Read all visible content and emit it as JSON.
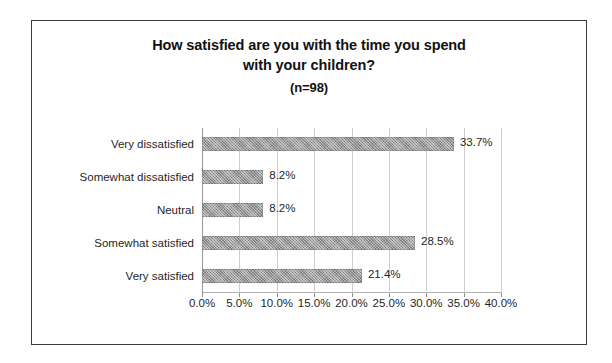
{
  "chart_data": {
    "type": "bar",
    "orientation": "horizontal",
    "title": "How satisfied are you with the time you spend with your children?",
    "title_line1": "How satisfied are you with the time you spend",
    "title_line2": "with your children?",
    "sample_size_label": "(n=98)",
    "sample_size": 98,
    "categories": [
      "Very dissatisfied",
      "Somewhat dissatisfied",
      "Neutral",
      "Somewhat satisfied",
      "Very satisfied"
    ],
    "values": [
      33.7,
      8.2,
      8.2,
      28.5,
      21.4
    ],
    "data_labels": [
      "33.7%",
      "8.2%",
      "8.2%",
      "28.5%",
      "21.4%"
    ],
    "xlabel": "",
    "ylabel": "",
    "xlim": [
      0,
      40
    ],
    "xtick_values": [
      0,
      5,
      10,
      15,
      20,
      25,
      30,
      35,
      40
    ],
    "xtick_labels": [
      "0.0%",
      "5.0%",
      "10.0%",
      "15.0%",
      "20.0%",
      "25.0%",
      "30.0%",
      "35.0%",
      "40.0%"
    ],
    "grid": true,
    "grid_axis": "x",
    "legend": false,
    "bar_color": "#9a9a9a",
    "border_color": "#3a3a3a",
    "background": "#ffffff"
  }
}
